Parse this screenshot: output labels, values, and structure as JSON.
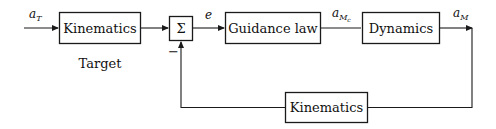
{
  "diagram": {
    "type": "block-diagram",
    "blocks": {
      "target_kinematics": {
        "label": "Kinematics",
        "caption": "Target"
      },
      "summing_junction": {
        "label": "Σ",
        "minus_sign": "−"
      },
      "guidance_law": {
        "label": "Guidance law"
      },
      "dynamics": {
        "label": "Dynamics"
      },
      "feedback_kinematics": {
        "label": "Kinematics"
      }
    },
    "signals": {
      "target_accel": {
        "base": "a",
        "sub": "T"
      },
      "error": {
        "base": "e"
      },
      "commanded_accel": {
        "base": "a",
        "sub": "M",
        "subsub": "c"
      },
      "missile_accel": {
        "base": "a",
        "sub": "M"
      }
    },
    "edges": [
      {
        "from": "input",
        "to": "target_kinematics",
        "label": "a_T"
      },
      {
        "from": "target_kinematics",
        "to": "summing_junction",
        "sign": "+"
      },
      {
        "from": "summing_junction",
        "to": "guidance_law",
        "label": "e"
      },
      {
        "from": "guidance_law",
        "to": "dynamics",
        "label": "a_Mc"
      },
      {
        "from": "dynamics",
        "to": "output",
        "label": "a_M"
      },
      {
        "from": "output",
        "to": "feedback_kinematics"
      },
      {
        "from": "feedback_kinematics",
        "to": "summing_junction",
        "sign": "−"
      }
    ]
  }
}
